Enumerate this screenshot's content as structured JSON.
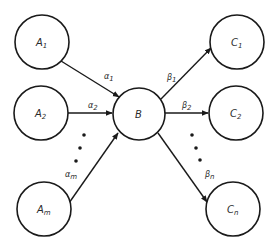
{
  "diagram": {
    "type": "network",
    "colors": {
      "stroke": "#1a1a1a",
      "text": "#2a2a2a",
      "background": "#ffffff"
    },
    "center": {
      "id": "B",
      "label": "B",
      "cx": 139,
      "cy": 114,
      "r": 26
    },
    "inputs": [
      {
        "id": "A1",
        "base": "A",
        "sub": "1",
        "cx": 42,
        "cy": 42,
        "r": 27
      },
      {
        "id": "A2",
        "base": "A",
        "sub": "2",
        "cx": 41,
        "cy": 113,
        "r": 27
      },
      {
        "id": "Am",
        "base": "A",
        "sub": "m",
        "cx": 44,
        "cy": 209,
        "r": 27
      }
    ],
    "outputs": [
      {
        "id": "C1",
        "base": "C",
        "sub": "1",
        "cx": 237,
        "cy": 42,
        "r": 27
      },
      {
        "id": "C2",
        "base": "C",
        "sub": "2",
        "cx": 236,
        "cy": 113,
        "r": 27
      },
      {
        "id": "Cn",
        "base": "C",
        "sub": "n",
        "cx": 233,
        "cy": 209,
        "r": 27
      }
    ],
    "input_edges": [
      {
        "from": "A1",
        "to": "B",
        "base": "α",
        "sub": "1"
      },
      {
        "from": "A2",
        "to": "B",
        "base": "α",
        "sub": "2"
      },
      {
        "from": "Am",
        "to": "B",
        "base": "α",
        "sub": "m"
      }
    ],
    "output_edges": [
      {
        "from": "B",
        "to": "C1",
        "base": "β",
        "sub": "1"
      },
      {
        "from": "B",
        "to": "C2",
        "base": "β",
        "sub": "2"
      },
      {
        "from": "B",
        "to": "Cn",
        "base": "β",
        "sub": "n"
      }
    ],
    "ellipsis_left": [
      [
        84,
        135
      ],
      [
        80,
        148
      ],
      [
        76,
        161
      ]
    ],
    "ellipsis_right": [
      [
        192,
        135
      ],
      [
        196,
        148
      ],
      [
        200,
        160
      ]
    ]
  }
}
